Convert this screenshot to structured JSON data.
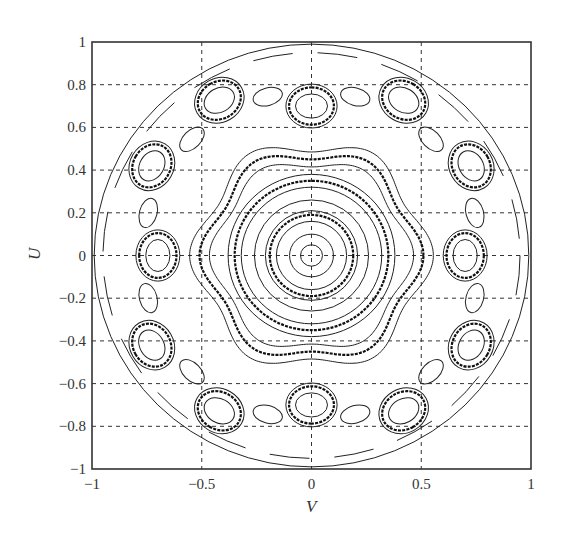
{
  "chart_data": {
    "type": "contour",
    "title": "",
    "xlabel": "V",
    "ylabel": "U",
    "xlim": [
      -1,
      1
    ],
    "ylim": [
      -1,
      1
    ],
    "grid": true,
    "grid_style": "dashed",
    "legend": null,
    "xticks": [
      -1,
      -0.5,
      0,
      0.5,
      1
    ],
    "xtick_labels": [
      "-1",
      "-0.5",
      "0",
      "0.5",
      "1"
    ],
    "yticks": [
      1,
      0.8,
      0.6,
      0.4,
      0.2,
      0,
      -0.2,
      -0.4,
      -0.6,
      -0.8,
      -1
    ],
    "ytick_labels": [
      "1",
      "0.8",
      "0.6",
      "0.4",
      "0.2",
      "0",
      "-0.2",
      "-0.4",
      "-0.6",
      "-0.8",
      "-1"
    ],
    "extra_grid_y": [
      0.8,
      0.6,
      0.4,
      0.2,
      0,
      -0.2,
      -0.4,
      -0.6,
      -0.8
    ],
    "extra_grid_x": [
      -0.5,
      0,
      0.5
    ],
    "domain_boundary_radius": 1.0,
    "symmetry": "12-fold (islands every 30 degrees)",
    "central_rings": [
      {
        "r": 0.05,
        "style": "thin"
      },
      {
        "r": 0.1,
        "style": "thin"
      },
      {
        "r": 0.16,
        "style": "thin"
      },
      {
        "r": 0.19,
        "style": "bold"
      },
      {
        "r": 0.21,
        "style": "thin"
      },
      {
        "r": 0.26,
        "style": "thin"
      },
      {
        "r": 0.32,
        "style": "thin"
      },
      {
        "r": 0.35,
        "style": "bold"
      },
      {
        "r": 0.38,
        "style": "thin"
      }
    ],
    "wavy_bands": [
      {
        "r": 0.44,
        "amp": 0.025,
        "k": 6,
        "phase": 0,
        "style": "thin"
      },
      {
        "r": 0.48,
        "amp": 0.03,
        "k": 6,
        "phase": 0,
        "style": "bold"
      },
      {
        "r": 0.52,
        "amp": 0.035,
        "k": 6,
        "phase": 0,
        "style": "thin"
      }
    ],
    "islands": {
      "count": 12,
      "start_angle_deg": 0,
      "step_deg": 30,
      "radius_axis": 0.7,
      "radius_diag": 0.84,
      "rings": [
        {
          "a": 0.055,
          "b": 0.075,
          "style": "thin"
        },
        {
          "a": 0.085,
          "b": 0.105,
          "style": "bold"
        },
        {
          "a": 0.1,
          "b": 0.12,
          "style": "thin"
        }
      ]
    },
    "outer_boundary": {
      "r": 0.99,
      "style": "thin"
    }
  }
}
